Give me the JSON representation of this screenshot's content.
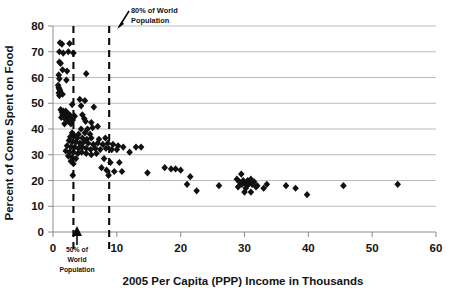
{
  "chart_data": {
    "type": "scatter",
    "title": "",
    "xlabel": "2005 Per Capita (PPP) Income in Thousands",
    "ylabel": "Percent of Come Spent on Food",
    "xlim": [
      0,
      60
    ],
    "ylim": [
      0,
      80
    ],
    "xticks": [
      0,
      10,
      20,
      30,
      40,
      50,
      60
    ],
    "xticklabels": [
      "0",
      "10",
      "20",
      "30",
      "40",
      "50",
      "60"
    ],
    "yticks": [
      0,
      10,
      20,
      30,
      40,
      50,
      60,
      70,
      80
    ],
    "yticklabels": [
      "0",
      "10",
      "20",
      "30",
      "40",
      "50",
      "60",
      "70",
      "80"
    ],
    "grid": "horizontal",
    "legend": "none",
    "marker": "diamond",
    "marker_color": "#111111",
    "annotations": [
      {
        "name": "80-percent-world-population",
        "text_line1": "80% of World",
        "text_line2": "Population",
        "x_value": 8.8,
        "style": "dashed-vertical-line-with-arrow"
      },
      {
        "name": "50-percent-world-population",
        "text_line1": "50% of",
        "text_line2": "World",
        "text_line3": "Population",
        "x_value": 3.2,
        "style": "dashed-vertical-line-with-arrow"
      }
    ],
    "points": [
      [
        1.1,
        73.5
      ],
      [
        1.4,
        73.0
      ],
      [
        2.6,
        73.2
      ],
      [
        1.0,
        70.0
      ],
      [
        1.6,
        69.5
      ],
      [
        2.4,
        70.0
      ],
      [
        3.2,
        69.5
      ],
      [
        1.0,
        66.0
      ],
      [
        1.2,
        65.5
      ],
      [
        1.5,
        63.0
      ],
      [
        2.2,
        62.5
      ],
      [
        5.2,
        61.5
      ],
      [
        0.9,
        61.0
      ],
      [
        1.0,
        59.5
      ],
      [
        2.1,
        59.0
      ],
      [
        0.8,
        57.0
      ],
      [
        0.9,
        56.0
      ],
      [
        1.0,
        55.5
      ],
      [
        1.1,
        55.0
      ],
      [
        0.9,
        54.0
      ],
      [
        1.2,
        54.0
      ],
      [
        1.5,
        53.5
      ],
      [
        1.0,
        53.0
      ],
      [
        4.2,
        51.5
      ],
      [
        5.0,
        51.0
      ],
      [
        3.0,
        49.5
      ],
      [
        4.4,
        49.0
      ],
      [
        6.4,
        48.5
      ],
      [
        1.2,
        47.5
      ],
      [
        1.6,
        47.0
      ],
      [
        2.0,
        47.0
      ],
      [
        1.4,
        46.5
      ],
      [
        1.8,
        46.0
      ],
      [
        2.3,
        46.0
      ],
      [
        2.6,
        45.5
      ],
      [
        1.5,
        45.5
      ],
      [
        1.9,
        45.0
      ],
      [
        2.2,
        45.0
      ],
      [
        1.3,
        44.5
      ],
      [
        1.7,
        44.5
      ],
      [
        2.5,
        44.0
      ],
      [
        2.9,
        44.5
      ],
      [
        3.4,
        45.0
      ],
      [
        4.6,
        45.5
      ],
      [
        2.1,
        43.5
      ],
      [
        2.4,
        43.0
      ],
      [
        3.1,
        43.5
      ],
      [
        4.9,
        44.0
      ],
      [
        5.1,
        43.0
      ],
      [
        6.0,
        42.5
      ],
      [
        2.8,
        42.0
      ],
      [
        1.8,
        42.0
      ],
      [
        4.4,
        40.0
      ],
      [
        5.4,
        40.0
      ],
      [
        6.2,
        40.5
      ],
      [
        7.0,
        41.0
      ],
      [
        3.0,
        38.5
      ],
      [
        4.0,
        38.0
      ],
      [
        5.0,
        38.5
      ],
      [
        5.8,
        38.0
      ],
      [
        2.7,
        37.0
      ],
      [
        3.3,
        37.5
      ],
      [
        3.8,
        36.5
      ],
      [
        4.6,
        36.5
      ],
      [
        5.3,
        36.0
      ],
      [
        6.0,
        36.5
      ],
      [
        7.2,
        36.0
      ],
      [
        8.2,
        36.5
      ],
      [
        2.5,
        35.5
      ],
      [
        3.0,
        35.0
      ],
      [
        3.6,
        35.0
      ],
      [
        4.2,
        34.5
      ],
      [
        4.8,
        35.0
      ],
      [
        5.5,
        34.5
      ],
      [
        6.3,
        34.0
      ],
      [
        7.0,
        34.5
      ],
      [
        7.8,
        34.0
      ],
      [
        8.6,
        34.5
      ],
      [
        9.4,
        34.0
      ],
      [
        10.2,
        33.5
      ],
      [
        2.2,
        33.5
      ],
      [
        2.8,
        33.0
      ],
      [
        3.4,
        33.0
      ],
      [
        4.0,
        32.5
      ],
      [
        4.6,
        33.0
      ],
      [
        5.2,
        32.5
      ],
      [
        5.9,
        32.0
      ],
      [
        6.6,
        32.5
      ],
      [
        7.4,
        32.0
      ],
      [
        8.3,
        32.5
      ],
      [
        9.2,
        32.0
      ],
      [
        10.0,
        32.0
      ],
      [
        11.0,
        33.0
      ],
      [
        13.0,
        33.0
      ],
      [
        13.8,
        33.0
      ],
      [
        2.0,
        31.5
      ],
      [
        2.6,
        31.0
      ],
      [
        3.2,
        31.0
      ],
      [
        3.9,
        30.5
      ],
      [
        4.5,
        31.0
      ],
      [
        5.2,
        30.5
      ],
      [
        6.0,
        30.0
      ],
      [
        6.8,
        30.5
      ],
      [
        12.0,
        31.0
      ],
      [
        2.4,
        29.5
      ],
      [
        3.0,
        29.0
      ],
      [
        3.6,
        28.5
      ],
      [
        8.0,
        28.5
      ],
      [
        9.0,
        27.0
      ],
      [
        10.4,
        27.0
      ],
      [
        2.8,
        27.5
      ],
      [
        3.2,
        26.5
      ],
      [
        7.6,
        25.0
      ],
      [
        8.4,
        24.0
      ],
      [
        9.6,
        23.5
      ],
      [
        10.8,
        23.5
      ],
      [
        17.5,
        25.0
      ],
      [
        18.5,
        24.5
      ],
      [
        19.2,
        24.5
      ],
      [
        20.0,
        24.0
      ],
      [
        14.8,
        23.0
      ],
      [
        3.1,
        22.0
      ],
      [
        8.7,
        22.0
      ],
      [
        21.5,
        21.5
      ],
      [
        29.5,
        22.5
      ],
      [
        28.8,
        20.5
      ],
      [
        29.8,
        20.0
      ],
      [
        30.5,
        20.0
      ],
      [
        31.0,
        20.5
      ],
      [
        29.2,
        19.5
      ],
      [
        30.0,
        19.0
      ],
      [
        30.8,
        19.0
      ],
      [
        31.5,
        19.5
      ],
      [
        29.6,
        18.5
      ],
      [
        30.4,
        18.0
      ],
      [
        31.2,
        18.5
      ],
      [
        32.0,
        18.0
      ],
      [
        21.0,
        18.5
      ],
      [
        26.0,
        18.0
      ],
      [
        33.5,
        18.5
      ],
      [
        29.0,
        17.5
      ],
      [
        30.2,
        17.0
      ],
      [
        31.8,
        17.5
      ],
      [
        33.0,
        17.0
      ],
      [
        36.5,
        18.0
      ],
      [
        38.0,
        17.0
      ],
      [
        45.5,
        18.0
      ],
      [
        54.0,
        18.5
      ],
      [
        22.5,
        16.0
      ],
      [
        30.0,
        15.5
      ],
      [
        31.0,
        15.5
      ],
      [
        39.8,
        14.5
      ]
    ]
  }
}
